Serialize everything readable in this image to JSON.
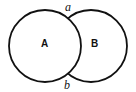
{
  "diagram": {
    "circles": [
      {
        "id": "A",
        "label": "A",
        "cx": 45,
        "cy": 46,
        "r": 36
      },
      {
        "id": "B",
        "label": "B",
        "cx": 91,
        "cy": 46,
        "r": 36
      }
    ],
    "intersections": [
      {
        "label": "a",
        "position": "top"
      },
      {
        "label": "b",
        "position": "bottom"
      }
    ],
    "stroke_color": "#111111"
  }
}
